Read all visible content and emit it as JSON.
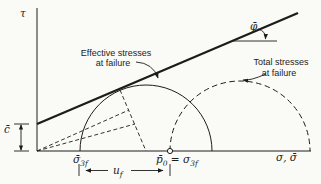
{
  "colors": {
    "ink": "#1c1c1c",
    "background": "#fafaf6"
  },
  "axes": {
    "y_label": "τ",
    "x_label": "σ, σ̄"
  },
  "envelope": {
    "phi_label": "φ̄",
    "cohesion_label": "c̄"
  },
  "annotations": {
    "effective": {
      "line1": "Effective stresses",
      "line2": "at failure"
    },
    "total": {
      "line1": "Total stresses",
      "line2": "at failure"
    }
  },
  "points": {
    "sigma3f_effective": {
      "base": "σ̄",
      "sub": "3f"
    },
    "p0_total": {
      "base": "p̄",
      "sub": "0",
      "equals": " = ",
      "sigma": "σ",
      "sigma_sub": "3f"
    }
  },
  "dimensions": {
    "pore_pressure": {
      "base": "u",
      "sub": "f"
    }
  }
}
